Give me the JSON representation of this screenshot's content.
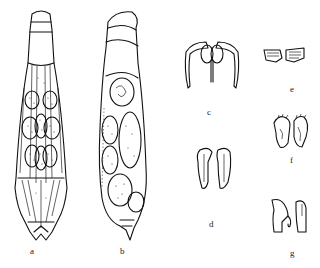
{
  "figure": {
    "panels": [
      {
        "id": "a",
        "label": "a",
        "description": "rotifer whole body, dorsal view"
      },
      {
        "id": "b",
        "label": "b",
        "description": "rotifer whole body, lateral view"
      },
      {
        "id": "c",
        "label": "c",
        "description": "trophi, frontal view"
      },
      {
        "id": "d",
        "label": "d",
        "description": "manubria pair"
      },
      {
        "id": "e",
        "label": "e",
        "description": "unci pair"
      },
      {
        "id": "f",
        "label": "f",
        "description": "rami with teeth"
      },
      {
        "id": "g",
        "label": "g",
        "description": "fulcrum/rami side view"
      }
    ]
  }
}
